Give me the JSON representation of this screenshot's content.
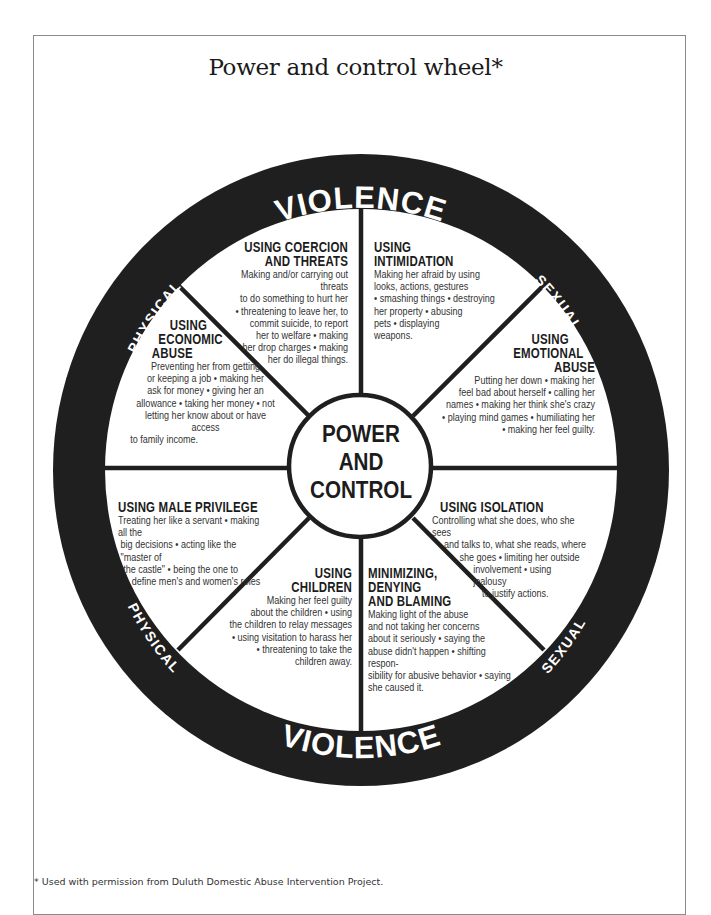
{
  "document": {
    "title": "Power and control wheel*",
    "footnote": "* Used with permission from Duluth Domestic Abuse Intervention Project."
  },
  "rim": {
    "top": {
      "left": "PHYSICAL",
      "center": "VIOLENCE",
      "right": "SEXUAL"
    },
    "bottom": {
      "left": "PHYSICAL",
      "center": "VIOLENCE",
      "right": "SEXUAL"
    }
  },
  "center": {
    "lines": [
      "POWER",
      "AND",
      "CONTROL"
    ]
  },
  "segments": [
    {
      "id": "coercion",
      "heading": [
        "USING COERCION",
        "AND THREATS"
      ],
      "body": [
        "Making and/or carrying out threats",
        "to do something to hurt her",
        "• threatening to leave her, to",
        "commit suicide, to report",
        "her to welfare • making",
        "her drop charges • making",
        "her do illegal things."
      ]
    },
    {
      "id": "intimidation",
      "heading": [
        "USING",
        "INTIMIDATION"
      ],
      "body": [
        "Making her afraid by using",
        "looks, actions, gestures",
        "• smashing things • destroying",
        "her property • abusing",
        "pets • displaying",
        "weapons."
      ]
    },
    {
      "id": "emotional",
      "heading": [
        "USING",
        "EMOTIONAL",
        "ABUSE"
      ],
      "body": [
        "Putting her down • making her",
        "feel bad about herself • calling her",
        "names • making her think she's crazy",
        "• playing mind games • humiliating her",
        "• making her feel guilty."
      ]
    },
    {
      "id": "isolation",
      "heading": [
        "USING ISOLATION"
      ],
      "body": [
        "Controlling what she does, who she sees",
        "and talks to, what she reads, where",
        "she goes • limiting her outside",
        "involvement • using jealousy",
        "to justify actions."
      ]
    },
    {
      "id": "minimizing",
      "heading": [
        "MINIMIZING,",
        "DENYING",
        "AND BLAMING"
      ],
      "body": [
        "Making light of the abuse",
        "and not taking her concerns",
        "about it seriously • saying the",
        "abuse didn't happen • shifting respon-",
        "sibility for abusive behavior • saying",
        "she caused it."
      ]
    },
    {
      "id": "children",
      "heading": [
        "USING",
        "CHILDREN"
      ],
      "body": [
        "Making her feel guilty",
        "about the children • using",
        "the children to relay messages",
        "• using visitation to harass her",
        "• threatening to take the",
        "children away."
      ]
    },
    {
      "id": "male-privilege",
      "heading": [
        "USING MALE PRIVILEGE"
      ],
      "body": [
        "Treating her like a servant • making all the",
        "big decisions • acting like the \"master of",
        "the castle\"  • being the one to",
        "define men's and women's roles"
      ]
    },
    {
      "id": "economic",
      "heading": [
        "USING",
        "ECONOMIC",
        "ABUSE"
      ],
      "body": [
        "Preventing her from getting",
        "or keeping a job • making her",
        "ask for money • giving her an",
        "allowance • taking her money • not",
        "letting her know about or have access",
        "to family income."
      ]
    }
  ],
  "colors": {
    "rim": "#1f1f1f",
    "spokes": "#1f1f1f",
    "background": "#ffffff",
    "rim_text": "#ffffff",
    "body_text": "#333333"
  }
}
